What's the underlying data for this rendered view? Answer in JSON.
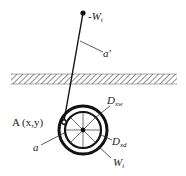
{
  "diagram": {
    "labels": {
      "top_weight": "-W",
      "top_weight_sub": "t",
      "cable_angle": "a'",
      "anchor_point": "A (x,y)",
      "angle_a": "a",
      "outer_diameter": "D",
      "outer_diameter_sub": "xw",
      "inner_diameter": "D",
      "inner_diameter_sub": "xd",
      "wheel_weight": "W",
      "wheel_weight_sub": "t"
    },
    "colors": {
      "stroke": "#111111",
      "hatch": "#333333",
      "text": "#222222"
    }
  }
}
